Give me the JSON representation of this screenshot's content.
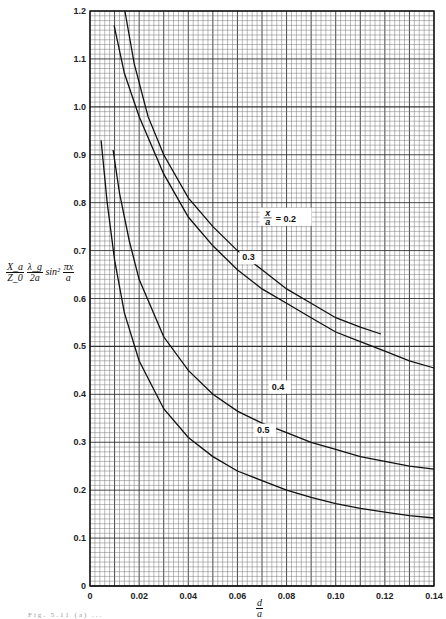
{
  "chart_data": {
    "type": "line",
    "title": "",
    "xlabel": "d/a",
    "ylabel": "(X_a/Z_0)(λ_g/2a) sin²(πx/a)",
    "xlim": [
      0,
      0.14
    ],
    "ylim": [
      0,
      1.2
    ],
    "grid": true,
    "x_ticks": [
      "0",
      "0.02",
      "0.04",
      "0.06",
      "0.08",
      "0.10",
      "0.12",
      "0.14"
    ],
    "y_ticks": [
      "0",
      "0.1",
      "0.2",
      "0.3",
      "0.4",
      "0.5",
      "0.6",
      "0.7",
      "0.8",
      "0.9",
      "1.0",
      "1.1",
      "1.2"
    ],
    "legend_position": "inline curve labels",
    "series": [
      {
        "name": "x/a = 0.2",
        "label": "x/a = 0.2",
        "x": [
          0.0142,
          0.018,
          0.0236,
          0.03,
          0.04,
          0.05,
          0.06,
          0.07,
          0.08,
          0.09,
          0.1,
          0.11,
          0.1184
        ],
        "y": [
          1.2,
          1.09,
          0.98,
          0.9,
          0.81,
          0.75,
          0.7,
          0.66,
          0.62,
          0.59,
          0.56,
          0.54,
          0.526
        ]
      },
      {
        "name": "x/a = 0.3",
        "label": "0.3",
        "x": [
          0.0098,
          0.014,
          0.02,
          0.03,
          0.04,
          0.05,
          0.06,
          0.07,
          0.08,
          0.09,
          0.1,
          0.11,
          0.12,
          0.13,
          0.14
        ],
        "y": [
          1.17,
          1.07,
          0.98,
          0.86,
          0.77,
          0.71,
          0.66,
          0.62,
          0.59,
          0.56,
          0.53,
          0.51,
          0.49,
          0.47,
          0.455
        ]
      },
      {
        "name": "x/a = 0.4",
        "label": "0.4",
        "x": [
          0.0094,
          0.012,
          0.016,
          0.02,
          0.03,
          0.04,
          0.05,
          0.06,
          0.07,
          0.08,
          0.09,
          0.1,
          0.11,
          0.12,
          0.13,
          0.14
        ],
        "y": [
          0.91,
          0.82,
          0.72,
          0.64,
          0.52,
          0.45,
          0.4,
          0.365,
          0.34,
          0.32,
          0.3,
          0.285,
          0.27,
          0.26,
          0.25,
          0.244
        ]
      },
      {
        "name": "x/a = 0.5",
        "label": "0.5",
        "x": [
          0.0045,
          0.007,
          0.01,
          0.014,
          0.02,
          0.03,
          0.04,
          0.05,
          0.06,
          0.07,
          0.08,
          0.09,
          0.1,
          0.11,
          0.12,
          0.13,
          0.14
        ],
        "y": [
          0.93,
          0.8,
          0.68,
          0.57,
          0.47,
          0.37,
          0.31,
          0.27,
          0.24,
          0.22,
          0.2,
          0.185,
          0.172,
          0.162,
          0.154,
          0.147,
          0.142
        ]
      }
    ],
    "label_positions": [
      {
        "series": 0,
        "x": 0.078,
        "y": 0.76
      },
      {
        "series": 1,
        "x": 0.062,
        "y": 0.68
      },
      {
        "series": 2,
        "x": 0.074,
        "y": 0.41
      },
      {
        "series": 3,
        "x": 0.068,
        "y": 0.32
      }
    ]
  },
  "axis": {
    "xlabel_num": "d",
    "xlabel_den": "a",
    "ylabel": {
      "x_num": "X_a",
      "x_den": "Z_0",
      "l_num": "λ_g",
      "l_den": "2a",
      "sin": "sin²",
      "p_num": "πx",
      "p_den": "a"
    }
  },
  "caption": "Fig. 5.11 (a) ..."
}
